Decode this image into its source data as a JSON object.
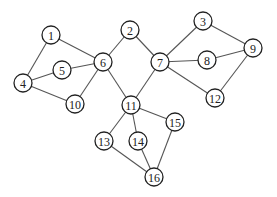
{
  "graph": {
    "nodes": [
      {
        "id": "1",
        "label": "1",
        "x": 51,
        "y": 35
      },
      {
        "id": "2",
        "label": "2",
        "x": 130,
        "y": 30
      },
      {
        "id": "3",
        "label": "3",
        "x": 203,
        "y": 21
      },
      {
        "id": "4",
        "label": "4",
        "x": 23,
        "y": 83
      },
      {
        "id": "5",
        "label": "5",
        "x": 62,
        "y": 70
      },
      {
        "id": "6",
        "label": "6",
        "x": 103,
        "y": 62
      },
      {
        "id": "7",
        "label": "7",
        "x": 160,
        "y": 62
      },
      {
        "id": "8",
        "label": "8",
        "x": 207,
        "y": 60
      },
      {
        "id": "9",
        "label": "9",
        "x": 253,
        "y": 48
      },
      {
        "id": "10",
        "label": "10",
        "x": 75,
        "y": 104
      },
      {
        "id": "11",
        "label": "11",
        "x": 131,
        "y": 105
      },
      {
        "id": "12",
        "label": "12",
        "x": 215,
        "y": 98
      },
      {
        "id": "13",
        "label": "13",
        "x": 104,
        "y": 141
      },
      {
        "id": "14",
        "label": "14",
        "x": 138,
        "y": 141
      },
      {
        "id": "15",
        "label": "15",
        "x": 175,
        "y": 122
      },
      {
        "id": "16",
        "label": "16",
        "x": 154,
        "y": 177
      }
    ],
    "edges": [
      [
        "1",
        "4"
      ],
      [
        "1",
        "6"
      ],
      [
        "4",
        "5"
      ],
      [
        "5",
        "6"
      ],
      [
        "4",
        "10"
      ],
      [
        "10",
        "6"
      ],
      [
        "6",
        "2"
      ],
      [
        "6",
        "11"
      ],
      [
        "2",
        "7"
      ],
      [
        "7",
        "11"
      ],
      [
        "7",
        "3"
      ],
      [
        "7",
        "8"
      ],
      [
        "7",
        "12"
      ],
      [
        "3",
        "9"
      ],
      [
        "8",
        "9"
      ],
      [
        "12",
        "9"
      ],
      [
        "11",
        "13"
      ],
      [
        "11",
        "14"
      ],
      [
        "11",
        "15"
      ],
      [
        "13",
        "16"
      ],
      [
        "14",
        "16"
      ],
      [
        "15",
        "16"
      ]
    ],
    "node_radius": 9
  }
}
